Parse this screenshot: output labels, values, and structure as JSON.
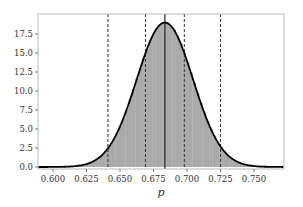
{
  "chart_data": {
    "type": "area",
    "title": "",
    "xlabel": "p",
    "ylabel": "",
    "xlim": [
      0.589,
      0.772
    ],
    "ylim": [
      0.0,
      20.1
    ],
    "grid": false,
    "legend": null,
    "x_ticks": [
      0.6,
      0.625,
      0.65,
      0.675,
      0.7,
      0.725,
      0.75
    ],
    "x_tick_labels": [
      "0.600",
      "0.625",
      "0.650",
      "0.675",
      "0.700",
      "0.725",
      "0.750"
    ],
    "y_ticks": [
      0.0,
      2.5,
      5.0,
      7.5,
      10.0,
      12.5,
      15.0,
      17.5
    ],
    "y_tick_labels": [
      "0.0",
      "2.5",
      "5.0",
      "7.5",
      "10.0",
      "12.5",
      "15.0",
      "17.5"
    ],
    "series": [
      {
        "name": "histogram",
        "kind": "histogram",
        "color": "#aaaaaa",
        "x": [
          0.59,
          0.6,
          0.61,
          0.62,
          0.63,
          0.64,
          0.65,
          0.66,
          0.67,
          0.68,
          0.69,
          0.7,
          0.71,
          0.72,
          0.73,
          0.74,
          0.75,
          0.76,
          0.77
        ],
        "values": [
          0.0,
          0.01,
          0.04,
          0.2,
          0.74,
          2.22,
          5.32,
          10.16,
          15.45,
          18.74,
          18.11,
          13.95,
          8.57,
          4.2,
          1.64,
          0.51,
          0.13,
          0.03,
          0.0
        ]
      },
      {
        "name": "density",
        "kind": "line",
        "color": "#000000",
        "distribution": {
          "type": "normal",
          "mean": 0.6835,
          "std": 0.021,
          "peak": 19.0
        }
      }
    ],
    "vertical_lines": [
      {
        "x": 0.641,
        "style": "dashed",
        "color": "#333333",
        "label": "2.5th percentile"
      },
      {
        "x": 0.669,
        "style": "dashed",
        "color": "#333333",
        "label": "25th percentile"
      },
      {
        "x": 0.6835,
        "style": "solid",
        "color": "#222222",
        "label": "mean"
      },
      {
        "x": 0.698,
        "style": "dashed",
        "color": "#333333",
        "label": "75th percentile"
      },
      {
        "x": 0.725,
        "style": "dashed",
        "color": "#333333",
        "label": "97.5th percentile"
      }
    ]
  },
  "layout": {
    "plot_left": 38,
    "plot_right": 284,
    "plot_top": 14,
    "plot_bottom": 169,
    "x0_px": 53,
    "x0_val": 0.6,
    "x_px_per_unit": 1340,
    "y0_px": 167,
    "y_px_per_unit": 7.6
  }
}
